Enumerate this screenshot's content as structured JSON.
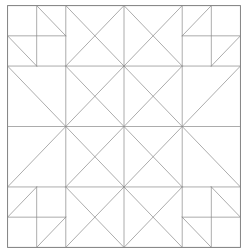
{
  "diagram": {
    "title": "",
    "type": "quilt-block-pattern",
    "grid_size": 4,
    "line_color": "#8a8a8a",
    "background": "#ffffff",
    "segments": [
      [
        0,
        1,
        4,
        1
      ],
      [
        0,
        2,
        4,
        2
      ],
      [
        0,
        3,
        4,
        3
      ],
      [
        1,
        0,
        1,
        4
      ],
      [
        2,
        0,
        2,
        4
      ],
      [
        3,
        0,
        3,
        4
      ],
      [
        0,
        0.5,
        1,
        0.5
      ],
      [
        0.5,
        0,
        0.5,
        1
      ],
      [
        0.5,
        0,
        1,
        0.5
      ],
      [
        0,
        0.5,
        0.5,
        1
      ],
      [
        3,
        0.5,
        4,
        0.5
      ],
      [
        3.5,
        0,
        3.5,
        1
      ],
      [
        3.5,
        0,
        3,
        0.5
      ],
      [
        4,
        0.5,
        3.5,
        1
      ],
      [
        0,
        3.5,
        1,
        3.5
      ],
      [
        0.5,
        3,
        0.5,
        4
      ],
      [
        0.5,
        3,
        0,
        3.5
      ],
      [
        1,
        3.5,
        0.5,
        4
      ],
      [
        3,
        3.5,
        4,
        3.5
      ],
      [
        3.5,
        3,
        3.5,
        4
      ],
      [
        3,
        3.5,
        3.5,
        4
      ],
      [
        3.5,
        3,
        4,
        3.5
      ],
      [
        1,
        0,
        2,
        1
      ],
      [
        2,
        1,
        3,
        0
      ],
      [
        1,
        2,
        2,
        1
      ],
      [
        2,
        1,
        3,
        2
      ],
      [
        1,
        2,
        2,
        3
      ],
      [
        2,
        3,
        3,
        2
      ],
      [
        1,
        4,
        2,
        3
      ],
      [
        2,
        3,
        3,
        4
      ],
      [
        0,
        1,
        1,
        2
      ],
      [
        1,
        2,
        0,
        3
      ],
      [
        4,
        1,
        3,
        2
      ],
      [
        3,
        2,
        4,
        3
      ],
      [
        1,
        1,
        3,
        3
      ],
      [
        3,
        1,
        1,
        3
      ],
      [
        1.5,
        0.5,
        2,
        1
      ],
      [
        1,
        2,
        1.5,
        1.5
      ],
      [
        0,
        1,
        1.5,
        2.5
      ],
      [
        2,
        1,
        1.5,
        0.5
      ]
    ]
  }
}
